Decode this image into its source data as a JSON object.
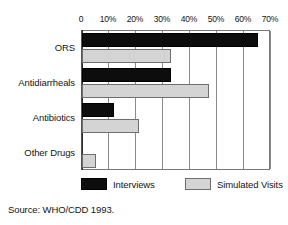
{
  "chart_data": {
    "type": "bar",
    "orientation": "horizontal",
    "title": "",
    "xlabel": "",
    "ylabel": "",
    "categories": [
      "ORS",
      "Antidiarrheals",
      "Antibiotics",
      "Other Drugs"
    ],
    "series": [
      {
        "name": "Interviews",
        "color": "#0d0d0d",
        "values": [
          65,
          33,
          12,
          0
        ]
      },
      {
        "name": "Simulated Visits",
        "color": "#d4d4d4",
        "values": [
          33,
          47,
          21,
          5
        ]
      }
    ],
    "xlim": [
      0,
      70
    ],
    "xticks": [
      0,
      10,
      20,
      30,
      40,
      50,
      60,
      70
    ],
    "xticklabels": [
      "0",
      "10%",
      "20%",
      "30%",
      "40%",
      "50%",
      "60%",
      "70%"
    ],
    "grid": "vertical",
    "legend_position": "bottom",
    "axis_position": "top",
    "source": "Source: WHO/CDD 1993."
  },
  "legend": {
    "items": [
      {
        "label": "Interviews"
      },
      {
        "label": "Simulated Visits"
      }
    ]
  },
  "footer": {
    "source": "Source: WHO/CDD 1993."
  }
}
